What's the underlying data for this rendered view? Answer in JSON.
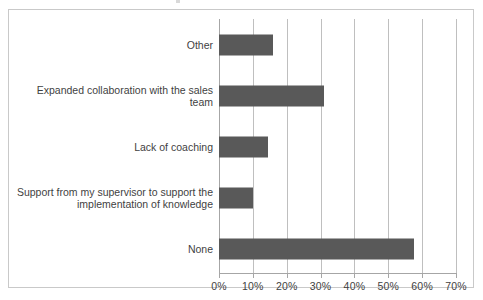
{
  "chart_data": {
    "type": "bar",
    "orientation": "horizontal",
    "title": "",
    "subtitle": "",
    "xlabel": "",
    "ylabel": "",
    "categories": [
      "Other",
      "Expanded collaboration with the sales team",
      "Lack of coaching",
      "Support from my supervisor to support the implementation of knowledge",
      "None"
    ],
    "values": [
      16,
      31,
      14.5,
      10,
      57.5
    ],
    "value_unit": "%",
    "xlim": [
      0,
      70
    ],
    "xticks": [
      0,
      10,
      20,
      30,
      40,
      50,
      60,
      70
    ],
    "xtick_labels": [
      "0%",
      "10%",
      "20%",
      "30%",
      "40%",
      "50%",
      "60%",
      "70%"
    ],
    "grid": true,
    "grid_axis": "x",
    "legend": false,
    "legend_position": "none",
    "series": [
      {
        "name": "",
        "values": [
          16,
          31,
          14.5,
          10,
          57.5
        ]
      }
    ],
    "annotations": [],
    "data_labels": false
  },
  "style": {
    "bar_color": "#595959",
    "gridline_color": "#bfbfbf",
    "axis_color": "#a6a6a6",
    "frame_color": "#c9c9c9",
    "text_color": "#3f3f3f",
    "background": "#ffffff"
  },
  "category_label_lines": [
    [
      "Other"
    ],
    [
      "Expanded collaboration with the sales team"
    ],
    [
      "Lack of coaching"
    ],
    [
      "Support from my supervisor to support the",
      "implementation of knowledge"
    ],
    [
      "None"
    ]
  ]
}
